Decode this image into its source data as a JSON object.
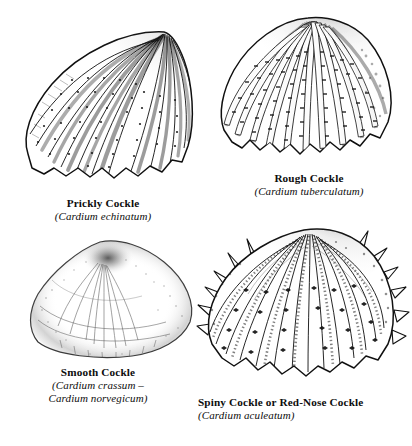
{
  "plate": {
    "background_color": "#ffffff",
    "ink_color": "#111111",
    "title": "",
    "figure_count": 4
  },
  "figures": [
    {
      "id": "prickly-cockle",
      "common_name": "Prickly Cockle",
      "scientific_name": "(Cardium echinatum)",
      "position": "top-left",
      "caption_align": "center",
      "rib_count": 18,
      "margin": "scalloped-pointed",
      "texture": "ribbed with beaded prickle rows and dark inter-rib shading"
    },
    {
      "id": "rough-cockle",
      "common_name": "Rough Cockle",
      "scientific_name": "(Cardium tuberculatum)",
      "position": "top-right",
      "caption_align": "center",
      "rib_count": 19,
      "margin": "scalloped-rounded",
      "texture": "broad pale ribs with dark tubercle tick marks"
    },
    {
      "id": "smooth-cockle",
      "common_name": "Smooth Cockle",
      "scientific_name_line1": "(Cardium crassum –",
      "scientific_name_line2": "Cardium norvegicum)",
      "position": "bottom-left",
      "caption_align": "center",
      "rib_count": 0,
      "margin": "smooth",
      "texture": "faint outline with stippled umbo shading and fine growth lines"
    },
    {
      "id": "spiny-cockle",
      "common_name": "Spiny Cockle or Red-Nose Cockle",
      "scientific_name": "(Cardium aculeatum)",
      "position": "bottom-right",
      "caption_align": "left",
      "rib_count": 20,
      "margin": "spined-scalloped",
      "texture": "ribs studded with spine bases and projecting marginal spines"
    }
  ]
}
